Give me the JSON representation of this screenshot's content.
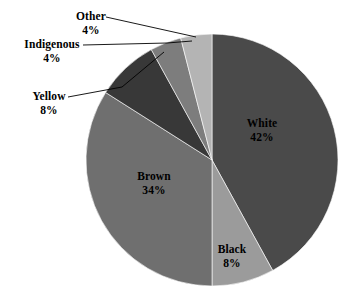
{
  "chart_data": {
    "type": "pie",
    "title": "",
    "subtitle": "",
    "xlabel": "",
    "ylabel": "",
    "legend_position": "none",
    "grid": false,
    "units": "percent",
    "total": 100,
    "start_angle_deg": 0,
    "direction": "clockwise",
    "categories": [
      "White",
      "Black",
      "Brown",
      "Yellow",
      "Indigenous",
      "Other"
    ],
    "values": [
      42,
      8,
      34,
      8,
      4,
      4
    ],
    "slices": [
      {
        "label": "White",
        "value": 42,
        "value_text": "42%",
        "color": "#4a4a4a",
        "label_placement": "inside",
        "has_leader_line": false
      },
      {
        "label": "Black",
        "value": 8,
        "value_text": "8%",
        "color": "#9b9b9b",
        "label_placement": "inside",
        "has_leader_line": false
      },
      {
        "label": "Brown",
        "value": 34,
        "value_text": "34%",
        "color": "#6f6f6f",
        "label_placement": "inside",
        "has_leader_line": false
      },
      {
        "label": "Yellow",
        "value": 8,
        "value_text": "8%",
        "color": "#383838",
        "label_placement": "outside",
        "has_leader_line": true
      },
      {
        "label": "Indigenous",
        "value": 4,
        "value_text": "4%",
        "color": "#7d7d7d",
        "label_placement": "outside",
        "has_leader_line": true
      },
      {
        "label": "Other",
        "value": 4,
        "value_text": "4%",
        "color": "#b4b4b4",
        "label_placement": "outside",
        "has_leader_line": true
      }
    ],
    "colors": {
      "white_slice": "#4a4a4a",
      "black_slice": "#9b9b9b",
      "brown_slice": "#6f6f6f",
      "yellow_slice": "#383838",
      "indigenous_slice": "#7d7d7d",
      "other_slice": "#b4b4b4",
      "background": "#ffffff",
      "text": "#000000",
      "leader_line": "#000000"
    }
  },
  "labels": {
    "white": {
      "name": "White",
      "value": "42%"
    },
    "black": {
      "name": "Black",
      "value": "8%"
    },
    "brown": {
      "name": "Brown",
      "value": "34%"
    },
    "yellow": {
      "name": "Yellow",
      "value": "8%"
    },
    "indigenous": {
      "name": "Indigenous",
      "value": "4%"
    },
    "other": {
      "name": "Other",
      "value": "4%"
    }
  }
}
